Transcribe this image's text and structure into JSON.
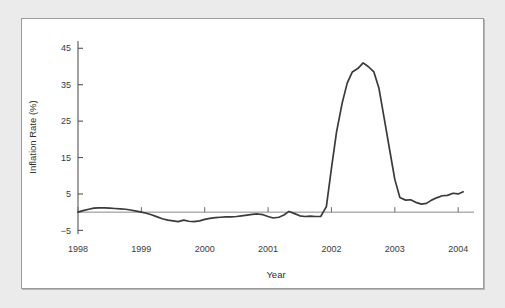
{
  "figure": {
    "background_color": "#ebebeb",
    "panel_color": "#ffffff",
    "frame_color": "#9a9a9a",
    "line_color": "#3a3a3a",
    "axis_color": "#555555",
    "zero_line_color": "#8a8a8a"
  },
  "chart_data": {
    "type": "line",
    "title": "",
    "subtitle": "",
    "xlabel": "Year",
    "ylabel": "Inflation Rate (%)",
    "xlim": [
      1998,
      2004.25
    ],
    "ylim": [
      -6,
      47
    ],
    "xticks": [
      1998,
      1999,
      2000,
      2001,
      2002,
      2003,
      2004
    ],
    "xtick_labels": [
      "1998",
      "1999",
      "2000",
      "2001",
      "2002",
      "2003",
      "2004"
    ],
    "yticks": [
      -5,
      5,
      15,
      25,
      35,
      45
    ],
    "ytick_labels": [
      "−5",
      "5",
      "15",
      "25",
      "35",
      "45"
    ],
    "grid": false,
    "legend": "none",
    "zero_reference_line": 0,
    "annotations": [],
    "series": [
      {
        "name": "Inflation Rate (%)",
        "color": "#3a3a3a",
        "x": [
          1998.0,
          1998.08,
          1998.17,
          1998.25,
          1998.33,
          1998.42,
          1998.5,
          1998.58,
          1998.67,
          1998.75,
          1998.83,
          1998.92,
          1999.0,
          1999.08,
          1999.17,
          1999.25,
          1999.33,
          1999.42,
          1999.5,
          1999.58,
          1999.67,
          1999.75,
          1999.83,
          1999.92,
          2000.0,
          2000.08,
          2000.17,
          2000.25,
          2000.33,
          2000.42,
          2000.5,
          2000.58,
          2000.67,
          2000.75,
          2000.83,
          2000.92,
          2001.0,
          2001.08,
          2001.17,
          2001.25,
          2001.33,
          2001.42,
          2001.5,
          2001.58,
          2001.67,
          2001.75,
          2001.83,
          2001.92,
          2002.0,
          2002.08,
          2002.17,
          2002.25,
          2002.33,
          2002.42,
          2002.5,
          2002.58,
          2002.67,
          2002.75,
          2002.83,
          2002.92,
          2003.0,
          2003.08,
          2003.17,
          2003.25,
          2003.33,
          2003.42,
          2003.5,
          2003.58,
          2003.67,
          2003.75,
          2003.83,
          2003.92,
          2004.0,
          2004.08
        ],
        "y": [
          0.0,
          0.4,
          0.8,
          1.1,
          1.2,
          1.2,
          1.1,
          1.0,
          0.9,
          0.8,
          0.6,
          0.3,
          0.0,
          -0.3,
          -0.8,
          -1.3,
          -1.8,
          -2.2,
          -2.4,
          -2.6,
          -2.2,
          -2.5,
          -2.6,
          -2.4,
          -2.0,
          -1.7,
          -1.5,
          -1.4,
          -1.3,
          -1.3,
          -1.2,
          -1.0,
          -0.8,
          -0.6,
          -0.5,
          -0.7,
          -1.2,
          -1.6,
          -1.4,
          -0.8,
          0.2,
          -0.4,
          -1.0,
          -1.2,
          -1.1,
          -1.2,
          -1.2,
          1.5,
          12.0,
          22.0,
          30.0,
          35.5,
          38.5,
          39.5,
          41.0,
          40.0,
          38.5,
          34.0,
          26.0,
          17.0,
          9.0,
          4.0,
          3.3,
          3.4,
          2.7,
          2.2,
          2.4,
          3.3,
          4.0,
          4.5,
          4.6,
          5.2,
          5.0,
          5.6
        ]
      }
    ]
  }
}
